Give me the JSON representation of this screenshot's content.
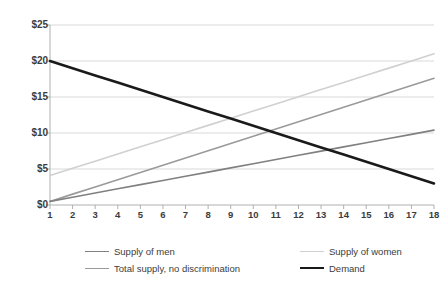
{
  "chart_data": {
    "type": "line",
    "title": "",
    "xlabel": "",
    "ylabel": "",
    "x": [
      1,
      2,
      3,
      4,
      5,
      6,
      7,
      8,
      9,
      10,
      11,
      12,
      13,
      14,
      15,
      16,
      17,
      18
    ],
    "xtick_labels": [
      "1",
      "2",
      "3",
      "4",
      "5",
      "6",
      "7",
      "8",
      "9",
      "10",
      "11",
      "12",
      "13",
      "14",
      "15",
      "16",
      "17",
      "18"
    ],
    "ytick_labels": [
      "$0",
      "$5",
      "$10",
      "$15",
      "$20",
      "$25"
    ],
    "ytick_values": [
      0,
      5,
      10,
      15,
      20,
      25
    ],
    "ylim": [
      0,
      25
    ],
    "xlim": [
      1,
      18
    ],
    "grid": "horizontal",
    "legend_position": "bottom",
    "series": [
      {
        "name": "Supply of men",
        "color": "#808080",
        "width": 1.6,
        "values": [
          0.5,
          1.08,
          1.66,
          2.25,
          2.83,
          3.41,
          3.99,
          4.57,
          5.16,
          5.74,
          6.32,
          6.9,
          7.48,
          8.07,
          8.65,
          9.23,
          9.81,
          10.4
        ]
      },
      {
        "name": "Supply of women",
        "color": "#d0d0d0",
        "width": 1.6,
        "values": [
          4.1,
          5.09,
          6.09,
          7.08,
          8.08,
          9.07,
          10.06,
          11.06,
          12.05,
          13.05,
          14.04,
          15.04,
          16.03,
          17.02,
          18.02,
          19.01,
          20.01,
          21.0
        ]
      },
      {
        "name": "Total supply, no discrimination",
        "color": "#9a9a9a",
        "width": 1.6,
        "values": [
          0.5,
          1.51,
          2.51,
          3.52,
          4.52,
          5.53,
          6.54,
          7.54,
          8.55,
          9.55,
          10.56,
          11.56,
          12.57,
          13.58,
          14.58,
          15.59,
          16.59,
          17.6
        ]
      },
      {
        "name": "Demand",
        "color": "#1a1a1a",
        "width": 2.6,
        "values": [
          20.0,
          19.0,
          18.0,
          17.0,
          16.0,
          15.0,
          14.0,
          13.0,
          12.0,
          11.0,
          10.0,
          9.0,
          8.0,
          7.0,
          6.0,
          5.0,
          4.0,
          3.0
        ]
      }
    ]
  },
  "legend": {
    "items": [
      {
        "label": "Supply of men",
        "color": "#808080",
        "width": 1.6
      },
      {
        "label": "Supply of women",
        "color": "#d0d0d0",
        "width": 1.6
      },
      {
        "label": "Total supply, no discrimination",
        "color": "#9a9a9a",
        "width": 1.6
      },
      {
        "label": "Demand",
        "color": "#1a1a1a",
        "width": 2.6
      }
    ]
  },
  "axes": {
    "axis_color": "#b0b0b0",
    "grid_color": "#d9d9d9",
    "tick_color": "#b0b0b0",
    "background": "#ffffff"
  }
}
